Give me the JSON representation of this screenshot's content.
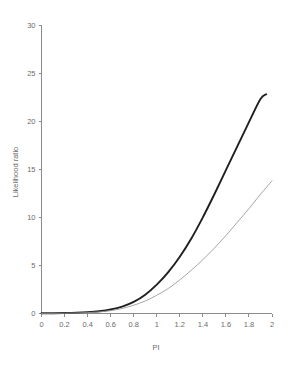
{
  "chart_data": {
    "type": "line",
    "title": "",
    "subtitle": "",
    "xlabel": "PI",
    "ylabel": "Likelihood ratio",
    "xlim": [
      0,
      2
    ],
    "ylim": [
      0,
      30
    ],
    "grid": false,
    "legend": "none",
    "xticks": [
      "0",
      "0.2",
      "0.4",
      "0.6",
      "0.8",
      "1",
      "1.2",
      "1.4",
      "1.6",
      "1.8",
      "2"
    ],
    "xtick_values": [
      0,
      0.2,
      0.4,
      0.6,
      0.8,
      1,
      1.2,
      1.4,
      1.6,
      1.8,
      2
    ],
    "yticks": [
      "0",
      "5",
      "10",
      "15",
      "20",
      "25",
      "30"
    ],
    "ytick_values": [
      0,
      5,
      10,
      15,
      20,
      25,
      30
    ],
    "x": [
      0,
      0.1,
      0.2,
      0.3,
      0.4,
      0.5,
      0.6,
      0.7,
      0.8,
      0.9,
      1.0,
      1.1,
      1.2,
      1.3,
      1.4,
      1.5,
      1.6,
      1.7,
      1.8,
      1.9,
      1.95,
      2.0
    ],
    "series": [
      {
        "name": "upper-curve",
        "color": "#1f1f1f",
        "width": 1.9,
        "x_end": 1.95,
        "y_end": 22.8,
        "values": [
          0.02,
          0.03,
          0.05,
          0.08,
          0.14,
          0.24,
          0.42,
          0.72,
          1.2,
          1.95,
          3.0,
          4.3,
          5.9,
          7.8,
          10.0,
          12.4,
          14.9,
          17.4,
          19.9,
          22.3,
          22.8,
          null
        ]
      },
      {
        "name": "lower-curve",
        "color": "#9b9b9b",
        "width": 0.9,
        "x_end": 2.0,
        "y_end": 13.8,
        "values": [
          0.01,
          0.02,
          0.03,
          0.05,
          0.09,
          0.16,
          0.3,
          0.52,
          0.86,
          1.3,
          1.9,
          2.6,
          3.5,
          4.5,
          5.6,
          6.8,
          8.1,
          9.5,
          10.9,
          12.4,
          13.1,
          13.8
        ]
      }
    ]
  },
  "axes": {
    "x_axis_name": "x-axis",
    "y_axis_name": "y-axis"
  }
}
